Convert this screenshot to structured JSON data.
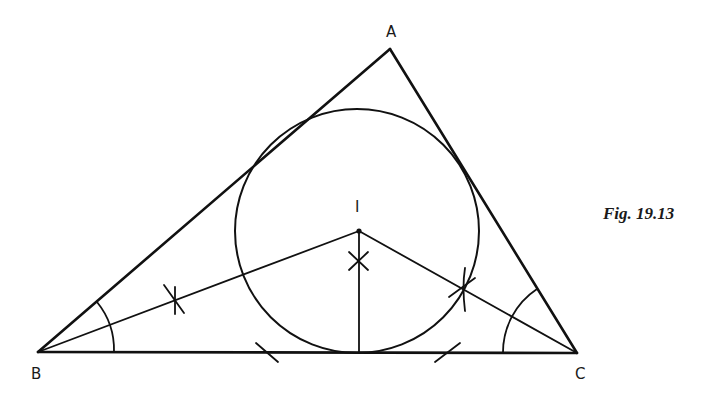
{
  "figure": {
    "caption": "Fig.  19.13",
    "labels": {
      "A": "A",
      "B": "B",
      "C": "C",
      "I": "I"
    },
    "stroke_color": "#111111",
    "points": {
      "A": [
        390,
        49
      ],
      "B": [
        38,
        352
      ],
      "C": [
        577,
        353
      ],
      "I": [
        359,
        231
      ],
      "foot": [
        359,
        353
      ]
    },
    "incircle": {
      "cx": 357,
      "cy": 231,
      "r": 122
    }
  }
}
